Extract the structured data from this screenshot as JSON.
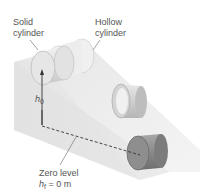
{
  "diagram": {
    "labels": {
      "solid_cylinder": [
        "Solid",
        "cylinder"
      ],
      "hollow_cylinder": [
        "Hollow",
        "cylinder"
      ],
      "initial_height": {
        "symbol": "h",
        "subscript": "0"
      },
      "zero_level": {
        "title": "Zero level",
        "symbol": "h",
        "subscript": "f",
        "equation": "= 0 m"
      }
    },
    "colors": {
      "incline_top": "#ebebeb",
      "incline_side": "#d6d6d6",
      "solid_cylinder": "#d9d9d9",
      "hollow_cylinder": "#cfcfcf",
      "bottom_cylinder": "#8c8c8c",
      "text": "#555555"
    }
  }
}
